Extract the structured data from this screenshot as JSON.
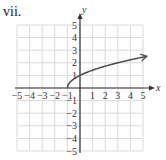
{
  "figure": {
    "label": "vii."
  },
  "chart_data": {
    "type": "line",
    "title": "",
    "xlabel": "x",
    "ylabel": "y",
    "xlim": [
      -5,
      5
    ],
    "ylim": [
      -5,
      5
    ],
    "grid": true,
    "x_tick_labels": [
      "−5",
      "−4",
      "−3",
      "−2",
      "−1",
      "1",
      "2",
      "3",
      "4",
      "5"
    ],
    "y_tick_labels": [
      "5",
      "4",
      "3",
      "2",
      "1",
      "−1",
      "−2",
      "−3",
      "−4",
      "−5"
    ],
    "series": [
      {
        "name": "y = sqrt(x + 1)",
        "x": [
          -1,
          -0.75,
          0,
          1,
          2,
          3,
          4,
          5
        ],
        "y": [
          0,
          0.5,
          1,
          1.414,
          1.732,
          2,
          2.236,
          2.449
        ],
        "start_point": [
          -1,
          0
        ],
        "end_arrow": true
      }
    ],
    "colors": {
      "curve": "#4a4a4a",
      "axes": "#333333",
      "grid": "#d9d9d9"
    }
  }
}
